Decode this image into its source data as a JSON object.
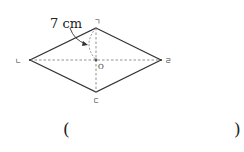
{
  "diagram": {
    "shape": "rhombus",
    "vertices": {
      "top": {
        "label": "ㄱ",
        "x": 96,
        "y": 28
      },
      "left": {
        "label": "ㄴ",
        "x": 30,
        "y": 60
      },
      "bottom": {
        "label": "ㄷ",
        "x": 96,
        "y": 92
      },
      "right": {
        "label": "ㄹ",
        "x": 161,
        "y": 60
      }
    },
    "center": {
      "label": "O",
      "x": 96,
      "y": 60
    },
    "measurement": {
      "label": "7 cm",
      "segment": "ㄱO"
    },
    "diagonals_style": "dashed"
  },
  "answer_box": {
    "open": "(",
    "close": ")"
  }
}
